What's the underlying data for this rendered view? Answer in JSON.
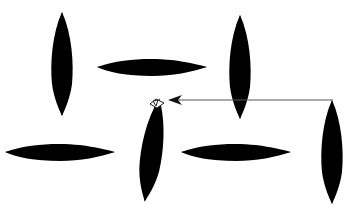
{
  "diagram": {
    "background": "#ffffff",
    "stroke_color": "#333333",
    "leaves": [
      {
        "id": "leaf-top-left-vertical",
        "orientation": "vertical",
        "cx": 62,
        "cy": 64,
        "length": 104,
        "width": 20
      },
      {
        "id": "leaf-top-center-horizontal",
        "orientation": "horizontal",
        "cx": 152,
        "cy": 67,
        "length": 110,
        "width": 18
      },
      {
        "id": "leaf-top-right-vertical",
        "orientation": "vertical",
        "cx": 240,
        "cy": 67,
        "length": 104,
        "width": 20
      },
      {
        "id": "leaf-bottom-left-horizontal",
        "orientation": "horizontal",
        "cx": 60,
        "cy": 152,
        "length": 110,
        "width": 18
      },
      {
        "id": "leaf-center-vertical-selected",
        "orientation": "vertical",
        "cx": 152,
        "cy": 150,
        "length": 104,
        "width": 20
      },
      {
        "id": "leaf-bottom-right-horizontal",
        "orientation": "horizontal",
        "cx": 236,
        "cy": 152,
        "length": 110,
        "width": 18
      },
      {
        "id": "leaf-far-right-vertical",
        "orientation": "vertical",
        "cx": 332,
        "cy": 152,
        "length": 104,
        "width": 20
      }
    ],
    "arrow": {
      "from": {
        "x": 333,
        "y": 100
      },
      "to": {
        "x": 168,
        "y": 100
      },
      "direction": "left"
    }
  }
}
